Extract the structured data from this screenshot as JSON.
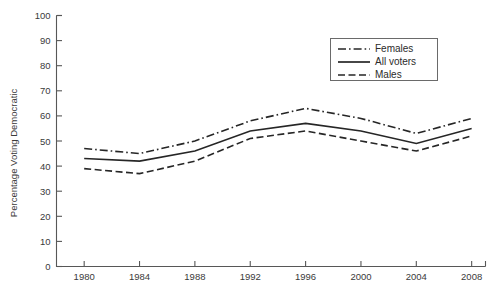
{
  "chart_data": {
    "type": "line",
    "title": "",
    "subtitle": "",
    "xlabel": "",
    "ylabel": "Percentage Voting Democratic",
    "x": [
      1980,
      1984,
      1988,
      1992,
      1996,
      2000,
      2004,
      2008
    ],
    "categories": [
      "1980",
      "1984",
      "1988",
      "1992",
      "1996",
      "2000",
      "2004",
      "2008"
    ],
    "xlim": [
      1978,
      2009
    ],
    "ylim": [
      0,
      100
    ],
    "xticks": [
      "1980",
      "1984",
      "1988",
      "1992",
      "1996",
      "2000",
      "2004",
      "2008"
    ],
    "yticks": [
      "0",
      "10",
      "20",
      "30",
      "40",
      "50",
      "60",
      "70",
      "80",
      "90",
      "100"
    ],
    "ytick_step": 10,
    "xtick_step": 4,
    "grid": false,
    "legend_position": "upper-right-inside",
    "series": [
      {
        "name": "Females",
        "style": "dash-dot",
        "color": "#262626",
        "values": [
          47,
          45,
          50,
          58,
          63,
          59,
          53,
          59
        ]
      },
      {
        "name": "All voters",
        "style": "solid",
        "color": "#262626",
        "values": [
          43,
          42,
          46,
          54,
          57,
          54,
          49,
          55
        ]
      },
      {
        "name": "Males",
        "style": "dashed",
        "color": "#262626",
        "values": [
          39,
          37,
          42,
          51,
          54,
          50,
          46,
          52
        ]
      }
    ]
  },
  "legend": {
    "entries": [
      {
        "label": "Females"
      },
      {
        "label": "All voters"
      },
      {
        "label": "Males"
      }
    ]
  },
  "colors": {
    "line": "#262626",
    "axis": "#575757",
    "text": "#3a3a3a",
    "background": "#ffffff"
  }
}
